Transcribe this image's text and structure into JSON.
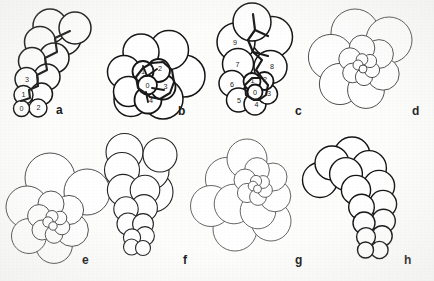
{
  "figure": {
    "background_color": "#fdfdfc",
    "ink_color": "#1a1a1a",
    "panel_count": 8
  },
  "panels": [
    {
      "id": "a",
      "label": "a",
      "label_x": 56,
      "label_y": 104,
      "arrangement": "biserial / serial chain",
      "line_weight": "heavy",
      "stroke": "#141414",
      "stroke_width": 1.5,
      "chamber_numbers": [
        "0",
        "1",
        "2",
        "3"
      ],
      "numbered": true,
      "circles": [
        {
          "cx": 21.5,
          "cy": 108.5,
          "r": 8.0,
          "w": 1.4
        },
        {
          "cx": 38.0,
          "cy": 108.0,
          "r": 9.0,
          "w": 1.4
        },
        {
          "cx": 23.5,
          "cy": 95.0,
          "r": 9.5,
          "w": 1.5
        },
        {
          "cx": 41.5,
          "cy": 94.0,
          "r": 11.0,
          "w": 1.5
        },
        {
          "cx": 26.5,
          "cy": 79.0,
          "r": 11.5,
          "w": 1.5
        },
        {
          "cx": 47.0,
          "cy": 77.0,
          "r": 13.0,
          "w": 1.5
        },
        {
          "cx": 32.0,
          "cy": 61.0,
          "r": 13.5,
          "w": 1.5
        },
        {
          "cx": 54.0,
          "cy": 58.0,
          "r": 15.0,
          "w": 1.5
        },
        {
          "cx": 40.0,
          "cy": 42.0,
          "r": 15.5,
          "w": 1.5
        },
        {
          "cx": 64.0,
          "cy": 38.0,
          "r": 17.0,
          "w": 1.5
        },
        {
          "cx": 50.0,
          "cy": 26.0,
          "r": 17.0,
          "w": 1.5
        },
        {
          "cx": 75.0,
          "cy": 28.0,
          "r": 16.0,
          "w": 1.5
        }
      ],
      "suture_path": "M 21 101 L 30 98 L 29 90 L 38 86 L 37 75 L 47 70 L 45 58 L 57 52 L 55 38 L 70 31",
      "labels": [
        {
          "text": "0",
          "x": 21.5,
          "y": 110.5
        },
        {
          "text": "1",
          "x": 23.5,
          "y": 97.0
        },
        {
          "text": "2",
          "x": 38.5,
          "y": 110.0
        },
        {
          "text": "3",
          "x": 27.0,
          "y": 82.0
        }
      ]
    },
    {
      "id": "b",
      "label": "b",
      "label_x": 178,
      "label_y": 105,
      "arrangement": "planispiral / involute rosette",
      "line_weight": "heavy",
      "stroke": "#141414",
      "stroke_width": 1.5,
      "chamber_numbers": [
        "0",
        "1",
        "2",
        "3",
        "4"
      ],
      "numbered": true,
      "circles": [
        {
          "cx": 147.5,
          "cy": 85.0,
          "r": 9.5,
          "w": 1.8
        },
        {
          "cx": 143.0,
          "cy": 71.5,
          "r": 10.5,
          "w": 1.8
        },
        {
          "cx": 158.5,
          "cy": 70.5,
          "r": 11.5,
          "w": 1.8
        },
        {
          "cx": 163.0,
          "cy": 87.0,
          "r": 12.5,
          "w": 1.8
        },
        {
          "cx": 148.0,
          "cy": 100.0,
          "r": 13.5,
          "w": 1.8
        },
        {
          "cx": 128.5,
          "cy": 91.5,
          "r": 15.0,
          "w": 1.5
        },
        {
          "cx": 124.0,
          "cy": 72.0,
          "r": 16.5,
          "w": 1.5
        },
        {
          "cx": 141.0,
          "cy": 52.0,
          "r": 18.0,
          "w": 1.5
        },
        {
          "cx": 169.0,
          "cy": 50.0,
          "r": 19.5,
          "w": 1.5
        },
        {
          "cx": 184.0,
          "cy": 76.0,
          "r": 21.0,
          "w": 1.5
        },
        {
          "cx": 163.0,
          "cy": 99.0,
          "r": 20.0,
          "w": 1.5
        },
        {
          "cx": 131.0,
          "cy": 99.5,
          "r": 17.0,
          "w": 1.5
        }
      ],
      "suture_path": "M 147 94 L 138 88 L 136 77 L 143 68 L 152 63 L 163 62 L 172 70 L 174 82 L 170 93 L 160 99 L 150 97 Z",
      "inner_spokes": [
        "M 147 76 L 143 66",
        "M 147 76 L 157 69",
        "M 152 88 L 164 90",
        "M 146 92 L 148 102"
      ],
      "labels": [
        {
          "text": "0",
          "x": 147.5,
          "y": 87.5
        },
        {
          "text": "1",
          "x": 143.0,
          "y": 73.5
        },
        {
          "text": "2",
          "x": 160.0,
          "y": 71.0
        },
        {
          "text": "3",
          "x": 165.5,
          "y": 88.5
        },
        {
          "text": "4",
          "x": 151.0,
          "y": 103.0
        }
      ]
    },
    {
      "id": "c",
      "label": "c",
      "label_x": 295,
      "label_y": 105,
      "arrangement": "trochospiral with 10 numbered chambers",
      "line_weight": "heavy",
      "stroke": "#141414",
      "stroke_width": 1.5,
      "chamber_numbers": [
        "0",
        "1",
        "2",
        "3",
        "4",
        "5",
        "6",
        "7",
        "8",
        "9"
      ],
      "numbered": true,
      "circles": [
        {
          "cx": 255.0,
          "cy": 92.0,
          "r": 7.5,
          "w": 1.8
        },
        {
          "cx": 252.0,
          "cy": 81.5,
          "r": 8.5,
          "w": 1.8
        },
        {
          "cx": 264.5,
          "cy": 81.0,
          "r": 9.0,
          "w": 1.8
        },
        {
          "cx": 267.5,
          "cy": 94.0,
          "r": 10.0,
          "w": 1.5
        },
        {
          "cx": 255.0,
          "cy": 104.0,
          "r": 11.0,
          "w": 1.5
        },
        {
          "cx": 238.5,
          "cy": 100.0,
          "r": 12.0,
          "w": 1.5
        },
        {
          "cx": 232.0,
          "cy": 83.5,
          "r": 13.0,
          "w": 1.5
        },
        {
          "cx": 238.0,
          "cy": 64.0,
          "r": 15.5,
          "w": 1.5
        },
        {
          "cx": 270.5,
          "cy": 67.0,
          "r": 16.5,
          "w": 1.5
        },
        {
          "cx": 236.0,
          "cy": 42.0,
          "r": 19.0,
          "w": 1.5
        },
        {
          "cx": 272.0,
          "cy": 37.0,
          "r": 20.5,
          "w": 1.5
        },
        {
          "cx": 252.0,
          "cy": 22.0,
          "r": 19.0,
          "w": 1.5
        }
      ],
      "suture_path": "M 254 100 L 246 95 L 245 85 L 252 78 L 262 78 L 268 85 L 266 95 L 259 100 Z",
      "bold_sutures": [
        "M 253 14 L 255 30 L 248 40 L 253 52 L 262 60 L 256 70 L 262 78",
        "M 255 30 L 268 36",
        "M 253 52 L 268 56"
      ],
      "labels": [
        {
          "text": "0",
          "x": 255.0,
          "y": 94.5
        },
        {
          "text": "1",
          "x": 252.5,
          "y": 83.0
        },
        {
          "text": "2",
          "x": 265.0,
          "y": 82.0
        },
        {
          "text": "3",
          "x": 269.0,
          "y": 96.0
        },
        {
          "text": "4",
          "x": 256.5,
          "y": 107.0
        },
        {
          "text": "5",
          "x": 239.0,
          "y": 103.0
        },
        {
          "text": "6",
          "x": 232.0,
          "y": 86.5
        },
        {
          "text": "7",
          "x": 237.5,
          "y": 66.5
        },
        {
          "text": "8",
          "x": 272.0,
          "y": 69.0
        },
        {
          "text": "9",
          "x": 235.0,
          "y": 45.0
        }
      ]
    },
    {
      "id": "d",
      "label": "d",
      "label_x": 412,
      "label_y": 105,
      "arrangement": "involute planispiral rosette, fine outline",
      "line_weight": "light",
      "stroke": "#3a3a3a",
      "stroke_width": 0.9,
      "numbered": false,
      "circles": [
        {
          "cx": 363.0,
          "cy": 69.0,
          "r": 4.0,
          "w": 0.9
        },
        {
          "cx": 358.0,
          "cy": 65.0,
          "r": 5.0,
          "w": 0.9
        },
        {
          "cx": 362.0,
          "cy": 59.5,
          "r": 5.8,
          "w": 0.9
        },
        {
          "cx": 370.0,
          "cy": 61.0,
          "r": 6.6,
          "w": 0.9
        },
        {
          "cx": 372.0,
          "cy": 70.0,
          "r": 7.6,
          "w": 0.9
        },
        {
          "cx": 364.0,
          "cy": 77.0,
          "r": 8.6,
          "w": 0.9
        },
        {
          "cx": 352.5,
          "cy": 73.0,
          "r": 9.8,
          "w": 0.9
        },
        {
          "cx": 350.0,
          "cy": 59.0,
          "r": 11.2,
          "w": 0.9
        },
        {
          "cx": 362.0,
          "cy": 48.0,
          "r": 12.8,
          "w": 0.9
        },
        {
          "cx": 379.0,
          "cy": 54.0,
          "r": 14.4,
          "w": 0.9
        },
        {
          "cx": 383.0,
          "cy": 74.0,
          "r": 16.2,
          "w": 0.9
        },
        {
          "cx": 366.0,
          "cy": 90.0,
          "r": 18.4,
          "w": 0.9
        },
        {
          "cx": 340.0,
          "cy": 84.0,
          "r": 20.6,
          "w": 0.9
        },
        {
          "cx": 331.0,
          "cy": 57.0,
          "r": 22.6,
          "w": 0.9
        },
        {
          "cx": 355.0,
          "cy": 33.0,
          "r": 24.0,
          "w": 0.9
        },
        {
          "cx": 389.0,
          "cy": 40.0,
          "r": 23.0,
          "w": 0.9
        }
      ]
    },
    {
      "id": "e",
      "label": "e",
      "label_x": 82,
      "label_y": 254,
      "arrangement": "low trochospiral rosette",
      "line_weight": "light",
      "stroke": "#3a3a3a",
      "stroke_width": 0.9,
      "numbered": false,
      "circles": [
        {
          "cx": 53.0,
          "cy": 226.0,
          "r": 4.2,
          "w": 0.9
        },
        {
          "cx": 48.0,
          "cy": 222.0,
          "r": 5.2,
          "w": 0.9
        },
        {
          "cx": 52.0,
          "cy": 216.5,
          "r": 6.0,
          "w": 0.9
        },
        {
          "cx": 60.0,
          "cy": 218.0,
          "r": 6.8,
          "w": 0.9
        },
        {
          "cx": 62.0,
          "cy": 227.0,
          "r": 7.8,
          "w": 0.9
        },
        {
          "cx": 54.0,
          "cy": 234.5,
          "r": 8.8,
          "w": 0.9
        },
        {
          "cx": 42.0,
          "cy": 230.0,
          "r": 10.0,
          "w": 0.9
        },
        {
          "cx": 39.0,
          "cy": 216.0,
          "r": 11.4,
          "w": 0.9
        },
        {
          "cx": 51.0,
          "cy": 204.0,
          "r": 13.0,
          "w": 0.9
        },
        {
          "cx": 69.0,
          "cy": 210.0,
          "r": 14.6,
          "w": 0.9
        },
        {
          "cx": 72.0,
          "cy": 230.0,
          "r": 16.4,
          "w": 0.9
        },
        {
          "cx": 54.0,
          "cy": 245.0,
          "r": 18.4,
          "w": 0.9
        },
        {
          "cx": 29.0,
          "cy": 236.0,
          "r": 17.5,
          "w": 0.9
        },
        {
          "cx": 27.0,
          "cy": 207.0,
          "r": 21.0,
          "w": 0.9
        },
        {
          "cx": 50.0,
          "cy": 178.0,
          "r": 25.0,
          "w": 0.9
        },
        {
          "cx": 87.0,
          "cy": 192.0,
          "r": 23.0,
          "w": 0.9
        }
      ]
    },
    {
      "id": "f",
      "label": "f",
      "label_x": 183,
      "label_y": 254,
      "arrangement": "high trochospiral, elongate",
      "line_weight": "medium",
      "stroke": "#242424",
      "stroke_width": 1.1,
      "numbered": false,
      "circles": [
        {
          "cx": 143.0,
          "cy": 248.0,
          "r": 7.5,
          "w": 1.1
        },
        {
          "cx": 131.5,
          "cy": 247.0,
          "r": 8.0,
          "w": 1.1
        },
        {
          "cx": 132.0,
          "cy": 237.5,
          "r": 8.6,
          "w": 1.1
        },
        {
          "cx": 145.0,
          "cy": 236.0,
          "r": 9.4,
          "w": 1.1
        },
        {
          "cx": 143.0,
          "cy": 224.0,
          "r": 10.4,
          "w": 1.1
        },
        {
          "cx": 128.0,
          "cy": 224.0,
          "r": 11.0,
          "w": 1.1
        },
        {
          "cx": 126.0,
          "cy": 209.0,
          "r": 12.2,
          "w": 1.1
        },
        {
          "cx": 144.0,
          "cy": 208.0,
          "r": 13.4,
          "w": 1.1
        },
        {
          "cx": 145.0,
          "cy": 190.0,
          "r": 14.8,
          "w": 1.1
        },
        {
          "cx": 123.0,
          "cy": 190.0,
          "r": 15.6,
          "w": 1.1
        },
        {
          "cx": 122.0,
          "cy": 170.0,
          "r": 17.5,
          "w": 1.1
        },
        {
          "cx": 150.0,
          "cy": 171.0,
          "r": 19.0,
          "w": 1.1
        },
        {
          "cx": 153.0,
          "cy": 192.0,
          "r": 20.0,
          "w": 1.1
        },
        {
          "cx": 124.5,
          "cy": 152.0,
          "r": 18.5,
          "w": 1.1
        },
        {
          "cx": 160.0,
          "cy": 155.0,
          "r": 17.0,
          "w": 1.1
        }
      ]
    },
    {
      "id": "g",
      "label": "g",
      "label_x": 295,
      "label_y": 254,
      "arrangement": "asymmetric spiral, center offset upper-right",
      "line_weight": "light",
      "stroke": "#4a4a4a",
      "stroke_width": 0.85,
      "numbered": false,
      "circles": [
        {
          "cx": 257.5,
          "cy": 189.0,
          "r": 4.0,
          "w": 0.85
        },
        {
          "cx": 253.0,
          "cy": 186.0,
          "r": 4.8,
          "w": 0.85
        },
        {
          "cx": 256.0,
          "cy": 181.0,
          "r": 5.6,
          "w": 0.85
        },
        {
          "cx": 263.0,
          "cy": 182.0,
          "r": 6.4,
          "w": 0.85
        },
        {
          "cx": 265.0,
          "cy": 190.0,
          "r": 7.4,
          "w": 0.85
        },
        {
          "cx": 258.0,
          "cy": 197.0,
          "r": 8.4,
          "w": 0.85
        },
        {
          "cx": 247.0,
          "cy": 193.0,
          "r": 9.6,
          "w": 0.85
        },
        {
          "cx": 245.0,
          "cy": 180.0,
          "r": 11.0,
          "w": 0.85
        },
        {
          "cx": 257.0,
          "cy": 170.0,
          "r": 12.4,
          "w": 0.85
        },
        {
          "cx": 273.0,
          "cy": 177.0,
          "r": 14.0,
          "w": 0.85
        },
        {
          "cx": 275.0,
          "cy": 196.0,
          "r": 15.8,
          "w": 0.85
        },
        {
          "cx": 258.0,
          "cy": 211.0,
          "r": 17.8,
          "w": 0.85
        },
        {
          "cx": 234.0,
          "cy": 204.0,
          "r": 19.8,
          "w": 0.85
        },
        {
          "cx": 227.0,
          "cy": 179.0,
          "r": 21.6,
          "w": 0.85
        },
        {
          "cx": 247.0,
          "cy": 159.0,
          "r": 20.0,
          "w": 0.85
        },
        {
          "cx": 235.0,
          "cy": 229.0,
          "r": 22.0,
          "w": 0.85
        },
        {
          "cx": 211.0,
          "cy": 206.0,
          "r": 20.5,
          "w": 0.85
        },
        {
          "cx": 271.0,
          "cy": 221.0,
          "r": 20.0,
          "w": 0.85
        }
      ]
    },
    {
      "id": "h",
      "label": "h",
      "label_x": 404,
      "label_y": 254,
      "arrangement": "uniserial / biserial chain, mirrored",
      "line_weight": "heavy",
      "stroke": "#141414",
      "stroke_width": 1.4,
      "numbered": false,
      "circles": [
        {
          "cx": 365.5,
          "cy": 250.0,
          "r": 8.0,
          "w": 1.4
        },
        {
          "cx": 379.5,
          "cy": 250.0,
          "r": 8.6,
          "w": 1.4
        },
        {
          "cx": 366.0,
          "cy": 237.0,
          "r": 9.4,
          "w": 1.4
        },
        {
          "cx": 382.0,
          "cy": 236.0,
          "r": 10.2,
          "w": 1.4
        },
        {
          "cx": 364.0,
          "cy": 223.0,
          "r": 11.0,
          "w": 1.4
        },
        {
          "cx": 383.5,
          "cy": 221.0,
          "r": 11.8,
          "w": 1.4
        },
        {
          "cx": 361.5,
          "cy": 207.0,
          "r": 12.8,
          "w": 1.4
        },
        {
          "cx": 383.0,
          "cy": 204.0,
          "r": 13.6,
          "w": 1.4
        },
        {
          "cx": 356.0,
          "cy": 190.0,
          "r": 14.6,
          "w": 1.4
        },
        {
          "cx": 379.0,
          "cy": 186.0,
          "r": 15.6,
          "w": 1.4
        },
        {
          "cx": 346.0,
          "cy": 174.0,
          "r": 16.4,
          "w": 1.4
        },
        {
          "cx": 369.0,
          "cy": 168.0,
          "r": 17.4,
          "w": 1.4
        },
        {
          "cx": 332.0,
          "cy": 163.0,
          "r": 17.0,
          "w": 1.4
        },
        {
          "cx": 352.0,
          "cy": 155.0,
          "r": 18.0,
          "w": 1.4
        },
        {
          "cx": 320.0,
          "cy": 180.0,
          "r": 17.5,
          "w": 1.4
        }
      ]
    }
  ]
}
